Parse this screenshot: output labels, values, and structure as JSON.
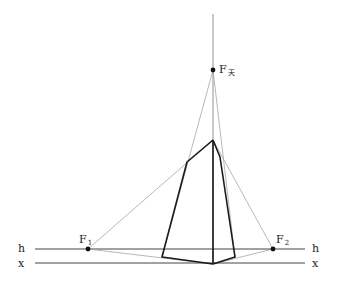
{
  "diagram": {
    "lines": {
      "horizon": {
        "label": "h",
        "y": 249,
        "x1": 35,
        "x2": 305
      },
      "ground": {
        "label": "x",
        "y": 263,
        "x1": 35,
        "x2": 305
      },
      "vertical_axis": {
        "x": 213,
        "y1": 14,
        "y2": 264
      }
    },
    "vanishing_points": [
      {
        "id": "F1",
        "label": "F",
        "sub": "1",
        "x": 88,
        "y": 249
      },
      {
        "id": "F2",
        "label": "F",
        "sub": "2",
        "x": 273,
        "y": 249
      },
      {
        "id": "Fsky",
        "label": "F",
        "sub": "天",
        "x": 213,
        "y": 70
      }
    ],
    "figure": {
      "top": {
        "x": 213,
        "y": 140
      },
      "upper_left": {
        "x": 187,
        "y": 162
      },
      "upper_right": {
        "x": 220,
        "y": 157
      },
      "bottom_left": {
        "x": 162,
        "y": 257
      },
      "bottom_center": {
        "x": 213,
        "y": 264
      },
      "bottom_right": {
        "x": 235,
        "y": 257
      }
    },
    "labels": {
      "h_left": "h",
      "h_right": "h",
      "x_left": "x",
      "x_right": "x",
      "f1": "F",
      "f1_sub": "1",
      "f2": "F",
      "f2_sub": "2",
      "fsky": "F",
      "fsky_sub": "天"
    },
    "colors": {
      "thick": "#1a1a1a",
      "thin": "#8a8a8a",
      "axis": "#555555"
    }
  }
}
